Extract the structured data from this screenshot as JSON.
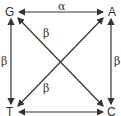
{
  "diagram": {
    "type": "mutation-transition-square",
    "nodes": {
      "top_left": "G",
      "top_right": "A",
      "bottom_left": "T",
      "bottom_right": "C"
    },
    "edges": [
      {
        "from": "G",
        "to": "A",
        "label": "α",
        "position": "top"
      },
      {
        "from": "G",
        "to": "T",
        "label": "β",
        "position": "left"
      },
      {
        "from": "A",
        "to": "C",
        "label": "β",
        "position": "right"
      },
      {
        "from": "T",
        "to": "C",
        "label": "α",
        "position": "bottom"
      },
      {
        "from": "G",
        "to": "C",
        "label": "β",
        "position": "diagonal-upper"
      },
      {
        "from": "T",
        "to": "A",
        "label": "β",
        "position": "diagonal-lower"
      }
    ],
    "stroke_color": "#333333"
  }
}
